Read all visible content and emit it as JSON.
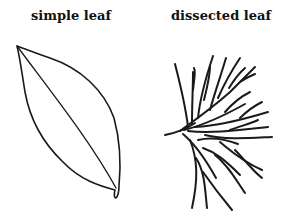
{
  "labels": {
    "simple": "simple leaf",
    "dissected": "dissected leaf"
  },
  "figures": [
    {
      "name": "simple leaf",
      "icon": "simple-leaf-icon"
    },
    {
      "name": "dissected leaf",
      "icon": "dissected-leaf-icon"
    }
  ],
  "colors": {
    "background": "#ffffff",
    "line": "#1a1a1a"
  }
}
